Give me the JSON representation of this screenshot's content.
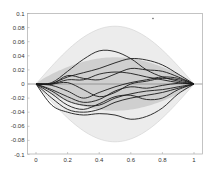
{
  "chart_data": {
    "type": "line",
    "title": "",
    "xlabel": "",
    "ylabel": "",
    "xlim": [
      -0.05,
      1.05
    ],
    "ylim": [
      -0.1,
      0.1
    ],
    "grid": false,
    "legend": null,
    "x_ticks": [
      "0",
      "0.2",
      "0.4",
      "0.6",
      "0.8",
      "1"
    ],
    "y_ticks": [
      "0.1",
      "0.08",
      "0.06",
      "0.04",
      "0.02",
      "0",
      "-0.02",
      "-0.04",
      "-0.06",
      "-0.08",
      "-0.1"
    ],
    "bands": [
      {
        "name": "outer-band",
        "color": "#ececec",
        "half_width_max": 0.082,
        "description": "light gray envelope, ±0.082 at x=0.5, zero at x=0 and x=1"
      },
      {
        "name": "inner-band",
        "color": "#cfcfcf",
        "upper_max": 0.041,
        "lower_min": -0.041,
        "description": "darker gray envelope"
      }
    ],
    "x": [
      0,
      0.1,
      0.2,
      0.3,
      0.4,
      0.5,
      0.6,
      0.7,
      0.8,
      0.9,
      1.0
    ],
    "series": [
      {
        "name": "path-1",
        "values": [
          0,
          0.002,
          0.018,
          0.035,
          0.047,
          0.046,
          0.036,
          0.02,
          0.01,
          0.004,
          0
        ]
      },
      {
        "name": "path-2",
        "values": [
          0,
          0.001,
          0.01,
          0.016,
          0.022,
          0.03,
          0.036,
          0.034,
          0.027,
          0.014,
          0
        ]
      },
      {
        "name": "path-3",
        "values": [
          0,
          0.0,
          0.012,
          0.008,
          0.006,
          0.014,
          0.022,
          0.02,
          0.018,
          0.01,
          0
        ]
      },
      {
        "name": "path-4",
        "values": [
          0,
          0.0,
          0.006,
          0.006,
          0.014,
          0.017,
          0.015,
          0.01,
          0.006,
          0.002,
          0
        ]
      },
      {
        "name": "path-5",
        "values": [
          0,
          0.0,
          0.002,
          -0.008,
          -0.018,
          -0.012,
          0.0,
          0.004,
          0.008,
          0.006,
          0
        ]
      },
      {
        "name": "path-6",
        "values": [
          0,
          -0.002,
          -0.01,
          -0.02,
          -0.012,
          -0.004,
          0.002,
          0.006,
          0.01,
          0.008,
          0
        ]
      },
      {
        "name": "path-7",
        "values": [
          0,
          -0.008,
          -0.018,
          -0.026,
          -0.022,
          -0.01,
          -0.004,
          -0.006,
          -0.002,
          0.001,
          0
        ]
      },
      {
        "name": "path-8",
        "values": [
          0,
          -0.01,
          -0.024,
          -0.03,
          -0.03,
          -0.02,
          -0.014,
          -0.01,
          -0.008,
          -0.004,
          0
        ]
      },
      {
        "name": "path-9",
        "values": [
          0,
          -0.014,
          -0.03,
          -0.036,
          -0.028,
          -0.018,
          -0.016,
          -0.022,
          -0.02,
          -0.008,
          0
        ]
      },
      {
        "name": "path-10",
        "values": [
          0,
          -0.02,
          -0.036,
          -0.04,
          -0.036,
          -0.026,
          -0.02,
          -0.016,
          -0.012,
          -0.006,
          0
        ]
      },
      {
        "name": "path-11",
        "values": [
          0,
          -0.03,
          -0.04,
          -0.044,
          -0.042,
          -0.044,
          -0.05,
          -0.046,
          -0.034,
          -0.014,
          0
        ]
      }
    ],
    "annotations": [
      {
        "type": "dot",
        "x": 0.74,
        "y": 0.093
      }
    ]
  }
}
